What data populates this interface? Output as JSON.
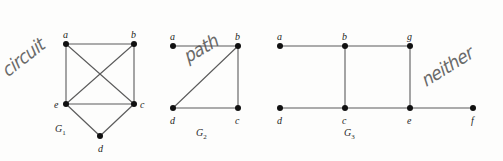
{
  "figure": {
    "width": 503,
    "height": 161,
    "background": "#fdfdfc",
    "edge_color": "#5b5b5b",
    "vertex_color": "#111111",
    "label_color": "#1d1d1d",
    "annotation_color": "#4a4a4a"
  },
  "graphs": [
    {
      "id": "G1",
      "caption": "G",
      "caption_subscript": "1",
      "caption_pos": {
        "x": 55,
        "y": 124
      },
      "annotation": "circuit",
      "annotation_pos": {
        "x": 10,
        "y": 62
      },
      "annotation_rotation": -38,
      "vertices": [
        {
          "name": "a",
          "x": 66,
          "y": 44,
          "label_dx": -3,
          "label_dy": -14
        },
        {
          "name": "b",
          "x": 134,
          "y": 44,
          "label_dx": -3,
          "label_dy": -14
        },
        {
          "name": "e",
          "x": 66,
          "y": 104,
          "label_dx": -12,
          "label_dy": -4
        },
        {
          "name": "c",
          "x": 134,
          "y": 104,
          "label_dx": 6,
          "label_dy": -4
        },
        {
          "name": "d",
          "x": 100,
          "y": 136,
          "label_dx": -2,
          "label_dy": 8
        }
      ],
      "edges": [
        [
          "a",
          "b"
        ],
        [
          "a",
          "e"
        ],
        [
          "a",
          "c"
        ],
        [
          "b",
          "e"
        ],
        [
          "b",
          "c"
        ],
        [
          "e",
          "c"
        ],
        [
          "e",
          "d"
        ],
        [
          "c",
          "d"
        ]
      ]
    },
    {
      "id": "G2",
      "caption": "G",
      "caption_subscript": "2",
      "caption_pos": {
        "x": 196,
        "y": 128
      },
      "annotation": "path",
      "annotation_pos": {
        "x": 190,
        "y": 48
      },
      "annotation_rotation": -30,
      "vertices": [
        {
          "name": "a",
          "x": 173,
          "y": 46,
          "label_dx": -3,
          "label_dy": -14
        },
        {
          "name": "b",
          "x": 238,
          "y": 46,
          "label_dx": -3,
          "label_dy": -14
        },
        {
          "name": "d",
          "x": 173,
          "y": 108,
          "label_dx": -3,
          "label_dy": 8
        },
        {
          "name": "c",
          "x": 238,
          "y": 108,
          "label_dx": -3,
          "label_dy": 8
        }
      ],
      "edges": [
        [
          "a",
          "b"
        ],
        [
          "b",
          "c"
        ],
        [
          "d",
          "c"
        ],
        [
          "d",
          "b"
        ]
      ]
    },
    {
      "id": "G3",
      "caption": "G",
      "caption_subscript": "3",
      "caption_pos": {
        "x": 344,
        "y": 128
      },
      "annotation": "neither",
      "annotation_pos": {
        "x": 428,
        "y": 72
      },
      "annotation_rotation": -32,
      "vertices": [
        {
          "name": "a",
          "x": 280,
          "y": 46,
          "label_dx": -3,
          "label_dy": -14
        },
        {
          "name": "b",
          "x": 345,
          "y": 46,
          "label_dx": -3,
          "label_dy": -14
        },
        {
          "name": "g",
          "x": 410,
          "y": 46,
          "label_dx": -3,
          "label_dy": -14
        },
        {
          "name": "d",
          "x": 280,
          "y": 108,
          "label_dx": -3,
          "label_dy": 8
        },
        {
          "name": "c",
          "x": 345,
          "y": 108,
          "label_dx": -3,
          "label_dy": 8
        },
        {
          "name": "e",
          "x": 410,
          "y": 108,
          "label_dx": -3,
          "label_dy": 8
        },
        {
          "name": "f",
          "x": 473,
          "y": 108,
          "label_dx": -2,
          "label_dy": 8
        }
      ],
      "edges": [
        [
          "a",
          "b"
        ],
        [
          "b",
          "g"
        ],
        [
          "d",
          "c"
        ],
        [
          "c",
          "e"
        ],
        [
          "e",
          "f"
        ],
        [
          "b",
          "c"
        ],
        [
          "g",
          "e"
        ]
      ]
    }
  ]
}
